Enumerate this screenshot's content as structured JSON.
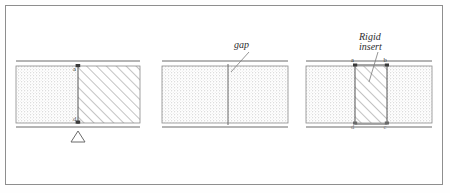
{
  "figure": {
    "border_color": "#8e8e8e",
    "background": "#ffffff",
    "line_color": "#4a4a4a",
    "hatch_color": "#6e6e6e",
    "stipple_color": "#b9b9b9"
  },
  "panel1": {
    "name": "beam-with-hatched-segment-and-support",
    "node_label_top": "a",
    "node_label_bottom": "d",
    "support_type": "pin-support-triangle"
  },
  "panel2": {
    "name": "beam-with-gap",
    "callout_label": "gap"
  },
  "panel3": {
    "name": "beam-with-rigid-insert",
    "callout_label_line1": "Rigid",
    "callout_label_line2": "insert",
    "corner_labels": {
      "top_left": "a",
      "top_right": "b",
      "bottom_left": "d",
      "bottom_right": "c"
    }
  }
}
